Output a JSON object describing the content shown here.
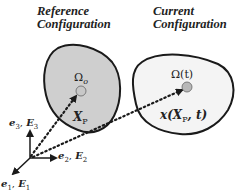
{
  "reference": {
    "title_line1": "Reference",
    "title_line2": "Configuration",
    "domain_label": "Ωo",
    "point_label": "X",
    "point_sub": "P",
    "fill": "#cfcfcf"
  },
  "current": {
    "title_line1": "Current",
    "title_line2": "Configuration",
    "domain_label": "Ω(t)",
    "mapping_label_pre": "x(X",
    "mapping_label_sub": "P",
    "mapping_label_post": ", t)",
    "fill": "#f4f4f4"
  },
  "axes": {
    "e1": "e",
    "e1_sub": "1",
    "E1": "E",
    "E1_sub": "1",
    "e2": "e",
    "e2_sub": "2",
    "E2": "E",
    "E2_sub": "2",
    "e3": "e",
    "e3_sub": "3",
    "E3": "E",
    "E3_sub": "3"
  },
  "colors": {
    "outline": "#1a1a1a",
    "point": "#bdbdbd"
  }
}
